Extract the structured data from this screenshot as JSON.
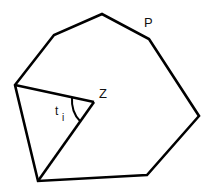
{
  "diagram": {
    "polygon_label": "P",
    "center_label": "Z",
    "angle_label_main": "t",
    "angle_label_sub": "i",
    "stroke_color": "#000000",
    "background": "#ffffff",
    "vertices": [
      [
        15,
        85
      ],
      [
        54,
        35
      ],
      [
        102,
        14
      ],
      [
        149,
        39
      ],
      [
        199,
        116
      ],
      [
        147,
        175
      ],
      [
        38,
        181
      ]
    ],
    "center": [
      94,
      102
    ]
  }
}
